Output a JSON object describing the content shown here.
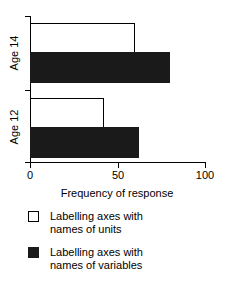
{
  "chart_data": {
    "type": "bar",
    "orientation": "horizontal",
    "title": "",
    "xlabel": "Frequency of response",
    "ylabel": "",
    "xlim": [
      0,
      100
    ],
    "xticks": [
      "0",
      "50",
      "100"
    ],
    "grid": false,
    "legend_position": "below",
    "categories": [
      "Age 14",
      "Age 12"
    ],
    "series": [
      {
        "name": "Labelling axes with names of units",
        "color": "#ffffff",
        "edge_color": "#000000",
        "values": [
          60,
          42
        ]
      },
      {
        "name": "Labelling axes with names of variables",
        "color": "#1a1a1a",
        "edge_color": "#1a1a1a",
        "values": [
          80,
          62
        ]
      }
    ]
  },
  "axis": {
    "x_title": "Frequency of response",
    "ticks": {
      "t0": "0",
      "t50": "50",
      "t100": "100"
    },
    "categories": {
      "age14": "Age 14",
      "age12": "Age 12"
    }
  },
  "legend": {
    "entries": [
      {
        "label_line1": "Labelling axes with",
        "label_line2": "names of units",
        "swatch": "white-square"
      },
      {
        "label_line1": "Labelling axes with",
        "label_line2": "names of variables",
        "swatch": "black-square"
      }
    ]
  }
}
